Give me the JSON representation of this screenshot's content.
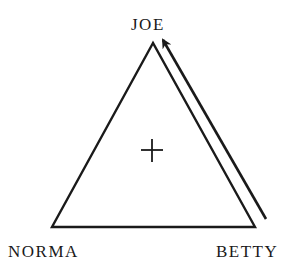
{
  "diagram": {
    "type": "triangle-relationship",
    "nodes": [
      {
        "id": "joe",
        "label": "JOE",
        "position": "top"
      },
      {
        "id": "norma",
        "label": "NORMA",
        "position": "bottom-left"
      },
      {
        "id": "betty",
        "label": "BETTY",
        "position": "bottom-right"
      }
    ],
    "edges": [
      {
        "from": "joe",
        "to": "norma",
        "style": "line"
      },
      {
        "from": "norma",
        "to": "betty",
        "style": "line"
      },
      {
        "from": "betty",
        "to": "joe",
        "style": "line"
      },
      {
        "from": "betty",
        "to": "joe",
        "style": "arrow",
        "note": "parallel arrow along right side pointing toward JOE"
      }
    ],
    "center_symbol": "+",
    "colors": {
      "stroke": "#1a1a1a",
      "background": "#ffffff"
    }
  }
}
